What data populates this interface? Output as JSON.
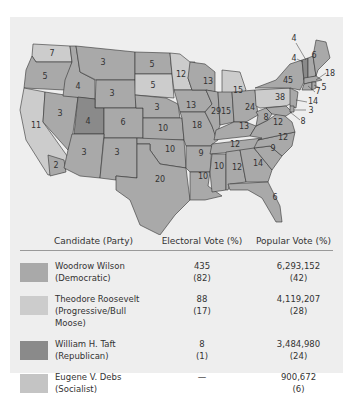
{
  "map": {
    "colors": {
      "wilson": "#a9a9a9",
      "roosevelt": "#cccccc",
      "taft": "#8a8a8a",
      "debs": "#c4c4c4",
      "background": "#eeeeee"
    },
    "state_labels": [
      {
        "state": "WA",
        "ev": "7",
        "winner": "roosevelt"
      },
      {
        "state": "OR",
        "ev": "5",
        "winner": "wilson"
      },
      {
        "state": "CA",
        "ev": "11",
        "winner": "roosevelt"
      },
      {
        "state": "CA-south",
        "ev": "2",
        "winner": "wilson"
      },
      {
        "state": "ID",
        "ev": "4",
        "winner": "wilson"
      },
      {
        "state": "NV",
        "ev": "3",
        "winner": "wilson"
      },
      {
        "state": "MT",
        "ev": "3",
        "winner": "wilson"
      },
      {
        "state": "WY",
        "ev": "3",
        "winner": "wilson"
      },
      {
        "state": "UT",
        "ev": "4",
        "winner": "taft"
      },
      {
        "state": "CO",
        "ev": "6",
        "winner": "wilson"
      },
      {
        "state": "AZ",
        "ev": "3",
        "winner": "wilson"
      },
      {
        "state": "NM",
        "ev": "3",
        "winner": "wilson"
      },
      {
        "state": "ND",
        "ev": "5",
        "winner": "wilson"
      },
      {
        "state": "SD",
        "ev": "5",
        "winner": "roosevelt"
      },
      {
        "state": "NE",
        "ev": "3",
        "winner": "wilson"
      },
      {
        "state": "KS",
        "ev": "10",
        "winner": "wilson"
      },
      {
        "state": "OK",
        "ev": "10",
        "winner": "wilson"
      },
      {
        "state": "TX",
        "ev": "20",
        "winner": "wilson"
      },
      {
        "state": "MN",
        "ev": "12",
        "winner": "roosevelt"
      },
      {
        "state": "IA",
        "ev": "13",
        "winner": "wilson"
      },
      {
        "state": "MO",
        "ev": "18",
        "winner": "wilson"
      },
      {
        "state": "AR",
        "ev": "9",
        "winner": "wilson"
      },
      {
        "state": "LA",
        "ev": "10",
        "winner": "wilson"
      },
      {
        "state": "WI",
        "ev": "13",
        "winner": "wilson"
      },
      {
        "state": "IL",
        "ev": "29",
        "winner": "wilson"
      },
      {
        "state": "MI",
        "ev": "15",
        "winner": "roosevelt"
      },
      {
        "state": "IN",
        "ev": "15",
        "winner": "wilson"
      },
      {
        "state": "OH",
        "ev": "24",
        "winner": "wilson"
      },
      {
        "state": "KY",
        "ev": "13",
        "winner": "wilson"
      },
      {
        "state": "TN",
        "ev": "12",
        "winner": "wilson"
      },
      {
        "state": "MS",
        "ev": "10",
        "winner": "wilson"
      },
      {
        "state": "AL",
        "ev": "12",
        "winner": "wilson"
      },
      {
        "state": "GA",
        "ev": "14",
        "winner": "wilson"
      },
      {
        "state": "FL",
        "ev": "6",
        "winner": "wilson"
      },
      {
        "state": "SC",
        "ev": "9",
        "winner": "wilson"
      },
      {
        "state": "NC",
        "ev": "12",
        "winner": "wilson"
      },
      {
        "state": "VA",
        "ev": "12",
        "winner": "wilson"
      },
      {
        "state": "WV",
        "ev": "8",
        "winner": "wilson"
      },
      {
        "state": "PA",
        "ev": "38",
        "winner": "roosevelt"
      },
      {
        "state": "NY",
        "ev": "45",
        "winner": "wilson"
      },
      {
        "state": "VT",
        "ev": "4",
        "winner": "taft"
      },
      {
        "state": "NH",
        "ev": "4",
        "winner": "wilson"
      },
      {
        "state": "ME",
        "ev": "6",
        "winner": "wilson"
      },
      {
        "state": "MA",
        "ev": "18",
        "winner": "wilson"
      },
      {
        "state": "RI",
        "ev": "5",
        "winner": "wilson"
      },
      {
        "state": "CT",
        "ev": "7",
        "winner": "wilson"
      },
      {
        "state": "NJ",
        "ev": "14",
        "winner": "wilson"
      },
      {
        "state": "DE",
        "ev": "3",
        "winner": "wilson"
      },
      {
        "state": "MD",
        "ev": "8",
        "winner": "wilson"
      }
    ]
  },
  "legend": {
    "headers": {
      "candidate": "Candidate (Party)",
      "electoral": "Electoral Vote (%)",
      "popular": "Popular Vote (%)"
    },
    "rows": [
      {
        "name": "Woodrow Wilson",
        "party": "(Democratic)",
        "ev": "435",
        "ev_pct": "(82)",
        "pv": "6,293,152",
        "pv_pct": "(42)",
        "color": "#a9a9a9"
      },
      {
        "name": "Theodore Roosevelt",
        "party": "(Progressive/Bull Moose)",
        "ev": "88",
        "ev_pct": "(17)",
        "pv": "4,119,207",
        "pv_pct": "(28)",
        "color": "#cccccc"
      },
      {
        "name": "William H. Taft",
        "party": "(Republican)",
        "ev": "8",
        "ev_pct": "(1)",
        "pv": "3,484,980",
        "pv_pct": "(24)",
        "color": "#8a8a8a"
      },
      {
        "name": "Eugene V. Debs",
        "party": "(Socialist)",
        "ev": "—",
        "ev_pct": "",
        "pv": "900,672",
        "pv_pct": "(6)",
        "color": "#c4c4c4"
      }
    ]
  }
}
